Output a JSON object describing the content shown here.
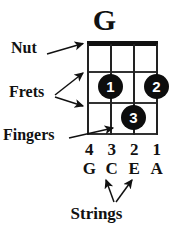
{
  "diagram": {
    "chord_name": "G",
    "instrument_strings": 4,
    "frets_shown": 3
  },
  "annotations": {
    "nut_label": "Nut",
    "frets_label": "Frets",
    "fingers_label": "Fingers",
    "strings_label": "Strings"
  },
  "fretboard": {
    "string_numbers": [
      "4",
      "3",
      "2",
      "1"
    ],
    "string_notes": [
      "G",
      "C",
      "E",
      "A"
    ],
    "fingerings": [
      {
        "finger": "1",
        "string_number": "3",
        "string_note": "C",
        "fret": 2
      },
      {
        "finger": "2",
        "string_number": "1",
        "string_note": "A",
        "fret": 2
      },
      {
        "finger": "3",
        "string_number": "2",
        "string_note": "E",
        "fret": 3
      }
    ]
  },
  "colors": {
    "background": "#ffffff",
    "ink": "#111111",
    "nut": "#111111",
    "fret_line": "#333333",
    "string_line": "#222222",
    "dot_fill": "#0d0d0d",
    "dot_text": "#ffffff"
  },
  "icons": {
    "nut_arrow": "arrow-right-up-icon",
    "fret_arrow_upper": "arrow-up-right-icon",
    "fret_arrow_lower": "arrow-down-right-icon",
    "finger_arrow": "arrow-right-up-icon",
    "string_arrow_left": "arrow-up-left-icon",
    "string_arrow_right": "arrow-up-right-icon"
  }
}
